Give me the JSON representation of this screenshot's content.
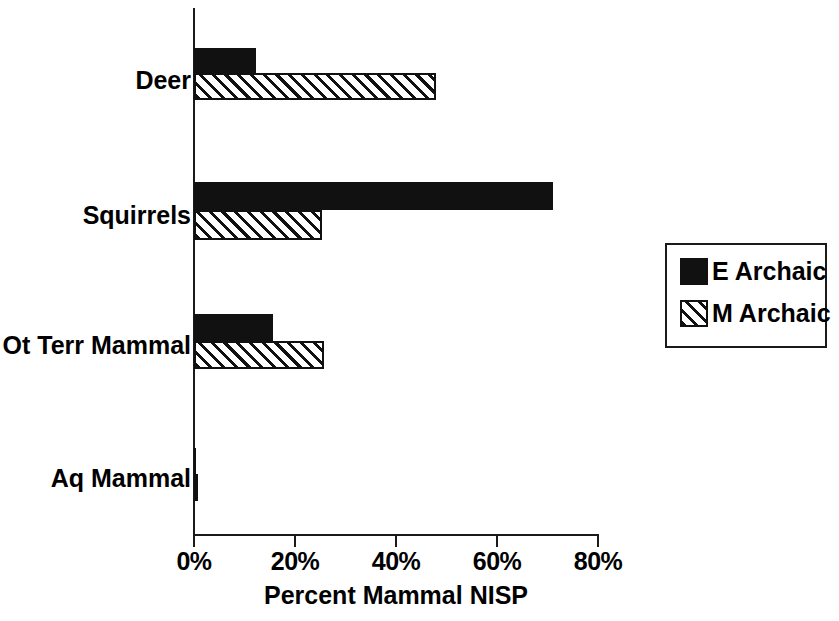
{
  "chart_data": {
    "type": "bar",
    "orientation": "horizontal",
    "title": "",
    "xlabel": "Percent Mammal NISP",
    "ylabel": "",
    "categories": [
      "Deer",
      "Squirrels",
      "Ot Terr Mammal",
      "Aq  Mammal"
    ],
    "series": [
      {
        "name": "E Archaic",
        "fill": "solid",
        "values": [
          12.3,
          71.0,
          15.6,
          0.4
        ]
      },
      {
        "name": "M Archaic",
        "fill": "hatch",
        "values": [
          48.0,
          25.4,
          25.7,
          0.3
        ]
      }
    ],
    "xlim": [
      0,
      80
    ],
    "xticks": [
      0,
      20,
      40,
      60,
      80
    ],
    "xticklabels": [
      "0%",
      "20%",
      "40%",
      "60%",
      "80%"
    ],
    "grid": false,
    "legend_position": "right",
    "colors": {
      "solid": "#111111",
      "hatch_line": "#111111",
      "hatch_bg": "#ffffff",
      "axis": "#1a1a1a"
    }
  },
  "legend": {
    "items": [
      {
        "label": "E Archaic"
      },
      {
        "label": "M Archaic"
      }
    ]
  },
  "geometry": {
    "x0_px": 194,
    "px_per_percent": 5.05,
    "rows": [
      {
        "solid_top": 48,
        "solid_h": 25,
        "hatch_top": 73,
        "hatch_h": 27,
        "label_top": 68
      },
      {
        "solid_top": 182,
        "solid_h": 28,
        "hatch_top": 210,
        "hatch_h": 30,
        "label_top": 203
      },
      {
        "solid_top": 314,
        "solid_h": 27,
        "hatch_top": 341,
        "hatch_h": 28,
        "label_top": 333
      },
      {
        "solid_top": 448,
        "solid_h": 26,
        "hatch_top": 474,
        "hatch_h": 27,
        "label_top": 466
      }
    ]
  }
}
